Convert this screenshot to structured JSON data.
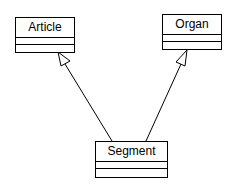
{
  "diagram": {
    "type": "UML class diagram",
    "classes": [
      {
        "id": "article",
        "name": "Article"
      },
      {
        "id": "organ",
        "name": "Organ"
      },
      {
        "id": "segment",
        "name": "Segment"
      }
    ],
    "relations": [
      {
        "type": "generalization",
        "from": "Segment",
        "to": "Article"
      },
      {
        "type": "generalization",
        "from": "Segment",
        "to": "Organ"
      }
    ]
  }
}
